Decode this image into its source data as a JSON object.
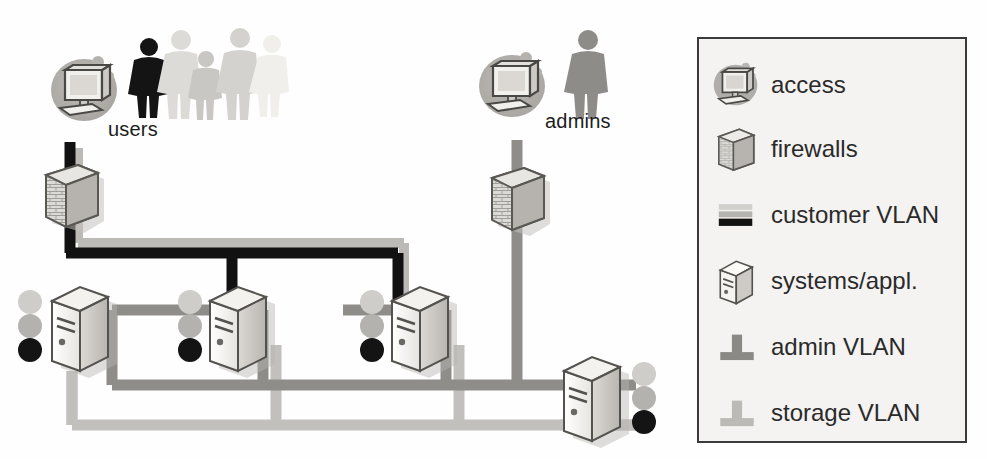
{
  "diagram": {
    "background": "#fefefe",
    "groups": {
      "users": {
        "label": "users",
        "x": 108,
        "y": 120,
        "icon": "access-workstation-icon",
        "people": 4
      },
      "admins": {
        "label": "admins",
        "x": 545,
        "y": 112,
        "icon": "access-workstation-icon",
        "people": 1
      }
    },
    "nodes": [
      {
        "name": "firewall-customer",
        "type": "firewall",
        "x": 45,
        "y": 165,
        "w": 52,
        "h": 62
      },
      {
        "name": "firewall-admin",
        "type": "firewall",
        "x": 492,
        "y": 168,
        "w": 52,
        "h": 62
      },
      {
        "name": "server-1",
        "type": "server",
        "x": 47,
        "y": 283,
        "indicators_side": "left",
        "indicators": [
          "#c9c9c9",
          "#b0b0b0",
          "#141414"
        ]
      },
      {
        "name": "server-2",
        "type": "server",
        "x": 205,
        "y": 283,
        "indicators_side": "left",
        "indicators": [
          "#c9c9c9",
          "#b0b0b0",
          "#141414"
        ]
      },
      {
        "name": "server-3",
        "type": "server",
        "x": 388,
        "y": 283,
        "indicators_side": "left",
        "indicators": [
          "#c9c9c9",
          "#b0b0b0",
          "#141414"
        ]
      },
      {
        "name": "server-4",
        "type": "server",
        "x": 562,
        "y": 357,
        "indicators_side": "right",
        "indicators": [
          "#c9c9c9",
          "#b0b0b0",
          "#141414"
        ]
      }
    ],
    "vlans": [
      {
        "name": "customer-vlan",
        "color": "#111111",
        "highlight": "#b9b9b9",
        "width": 11
      },
      {
        "name": "admin-vlan",
        "color": "#8c8c8c",
        "width": 11
      },
      {
        "name": "storage-vlan",
        "color": "#bdbdbd",
        "width": 11
      }
    ]
  },
  "legend": {
    "items": [
      {
        "label": "access",
        "icon": "access-workstation-icon"
      },
      {
        "label": "firewalls",
        "icon": "firewall-icon"
      },
      {
        "label": "customer VLAN",
        "icon": "customer-vlan-icon"
      },
      {
        "label": "systems/appl.",
        "icon": "server-icon"
      },
      {
        "label": "admin VLAN",
        "icon": "admin-vlan-icon"
      },
      {
        "label": "storage VLAN",
        "icon": "storage-vlan-icon"
      }
    ],
    "box_fill": "#f4f3f1",
    "box_border": "#3a3a3a"
  },
  "bleed_text": [
    "system editor",
    "in the related",
    "storage computer between",
    "resource management",
    "the DB of",
    "of its VLANs",
    "and of the",
    "content of the",
    "be sure to",
    "network in"
  ]
}
